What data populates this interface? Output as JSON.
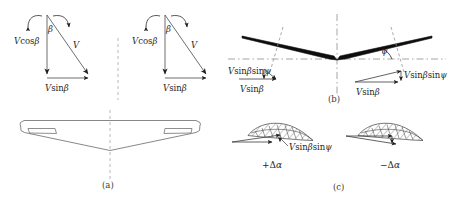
{
  "figure": {
    "background": "#ffffff",
    "ink": "#1f1f1f",
    "dash_color": "#9a9a9a",
    "fill_dark": "#0d0d0d",
    "width": 460,
    "height": 204
  },
  "panels": {
    "a": {
      "caption": "(a)",
      "description": "Wing planform top view with swept trailing edge and two tip control surfaces"
    },
    "b": {
      "caption": "(b)",
      "description": "Front view of dihedral wing showing dihedral angle psi"
    },
    "c": {
      "caption": "(c)",
      "description": "Airfoil sections showing induced angle of attack increments"
    }
  },
  "triangles": {
    "left": {
      "angle_label": "β",
      "vertical_label_math": "V",
      "vertical_label_fn": "cos",
      "vertical_label_arg": "β",
      "hyp_label": "V",
      "base_label_math": "V",
      "base_label_fn": "sin",
      "base_label_arg": "β"
    },
    "right": {
      "angle_label": "β",
      "vertical_label_math": "V",
      "vertical_label_fn": "cos",
      "vertical_label_arg": "β",
      "hyp_label": "V",
      "base_label_math": "V",
      "base_label_fn": "sin",
      "base_label_arg": "β"
    }
  },
  "panel_b": {
    "dihedral_angle_label": "ψ",
    "left_vector": {
      "vertical_math": "V",
      "vertical_fn1": "sin",
      "vertical_arg1": "β",
      "vertical_fn2": "sin",
      "vertical_arg2": "ψ",
      "base_math": "V",
      "base_fn": "sin",
      "base_arg": "β"
    },
    "right_vector": {
      "vertical_math": "V",
      "vertical_fn1": "sin",
      "vertical_arg1": "β",
      "vertical_fn2": "sin",
      "vertical_arg2": "ψ",
      "base_math": "V",
      "base_fn": "sin",
      "base_arg": "β"
    }
  },
  "panel_c": {
    "left_airfoil": {
      "vector_math": "V",
      "vector_fn1": "sin",
      "vector_arg1": "β",
      "vector_fn2": "sin",
      "vector_arg2": "ψ",
      "delta_sign": "+",
      "delta_symbol": "Δ",
      "delta_var": "α"
    },
    "right_airfoil": {
      "delta_sign": "−",
      "delta_symbol": "Δ",
      "delta_var": "α"
    }
  }
}
